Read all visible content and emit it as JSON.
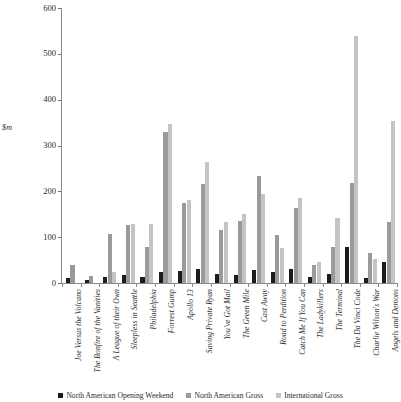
{
  "chart_data": {
    "type": "bar",
    "title": "",
    "xlabel": "",
    "ylabel": "$m",
    "ylim": [
      0,
      600
    ],
    "yticks": [
      0,
      100,
      200,
      300,
      400,
      500,
      600
    ],
    "grid": false,
    "legend_position": "bottom",
    "categories": [
      "Joe Versus the Volcano",
      "The Bonfire of the Vanities",
      "A League of their Own",
      "Sleepless in Seattle",
      "Philadelphia",
      "Forrest Gump",
      "Apollo 13",
      "Saving Private Ryan",
      "You've Got Mail",
      "The Green Mile",
      "Cast Away",
      "Road to Perdition",
      "Catch Me If You Can",
      "The Ladykillers",
      "The Terminal",
      "The Da Vinci Code",
      "Charlie Wilson's War",
      "Angels and Demons"
    ],
    "series": [
      {
        "name": "North American Opening Weekend",
        "color": "#1c1c1c",
        "values": [
          10,
          6,
          14,
          17,
          14,
          25,
          26,
          31,
          19,
          18,
          29,
          23,
          30,
          13,
          19,
          78,
          10,
          46
        ]
      },
      {
        "name": "North American Gross",
        "color": "#9a9a9a",
        "values": [
          39,
          16,
          108,
          127,
          78,
          330,
          174,
          217,
          116,
          136,
          234,
          105,
          164,
          39,
          78,
          218,
          66,
          133
        ]
      },
      {
        "name": "International Gross",
        "color": "#c4c4c4",
        "values": [
          0,
          0,
          24,
          128,
          129,
          348,
          181,
          264,
          134,
          150,
          195,
          76,
          186,
          45,
          141,
          540,
          53,
          353
        ]
      }
    ]
  },
  "legend": {
    "items": [
      "North American Opening Weekend",
      "North American Gross",
      "International Gross"
    ]
  }
}
